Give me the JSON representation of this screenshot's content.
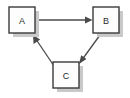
{
  "diagram": {
    "type": "directed-graph",
    "background_color": "#ffffff",
    "node_fill_color": "#fdfdfd",
    "node_border_color": "#3a3a3a",
    "node_shadow_color": "#c9c9c9",
    "edge_color": "#4a4a4a",
    "label_color": "#2b2b2b",
    "nodes": [
      {
        "id": "A",
        "label": "A",
        "x": 9,
        "y": 7,
        "width": 26,
        "height": 26
      },
      {
        "id": "B",
        "label": "B",
        "x": 93,
        "y": 7,
        "width": 26,
        "height": 26
      },
      {
        "id": "C",
        "label": "C",
        "x": 53,
        "y": 62,
        "width": 26,
        "height": 26
      }
    ],
    "edges": [
      {
        "id": "a-to-b",
        "from": "A",
        "to": "B",
        "label": "",
        "direction": "right"
      },
      {
        "id": "b-to-c",
        "from": "B",
        "to": "C",
        "label": "",
        "direction": "down-left"
      },
      {
        "id": "c-to-a",
        "from": "C",
        "to": "A",
        "label": "",
        "direction": "up-left"
      }
    ]
  }
}
